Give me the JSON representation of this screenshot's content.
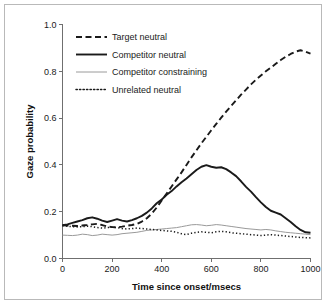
{
  "chart_data": {
    "type": "line",
    "title": "",
    "xlabel": "Time since onset/msecs",
    "ylabel": "Gaze probability",
    "xlim": [
      0,
      1000
    ],
    "ylim": [
      0.0,
      1.0
    ],
    "xticks": [
      0,
      200,
      400,
      600,
      800,
      1000
    ],
    "xtick_labels": [
      "0",
      "200",
      "400",
      "600",
      "800",
      "1000"
    ],
    "yticks": [
      0.0,
      0.2,
      0.4,
      0.6,
      0.8,
      1.0
    ],
    "ytick_labels": [
      "0.0",
      "0.2",
      "0.4",
      "0.6",
      "0.8",
      "1.0"
    ],
    "grid": false,
    "legend_position": "upper left",
    "x": [
      0,
      20,
      40,
      60,
      80,
      100,
      120,
      140,
      160,
      180,
      200,
      220,
      240,
      260,
      280,
      300,
      320,
      340,
      360,
      380,
      400,
      420,
      440,
      460,
      480,
      500,
      520,
      540,
      560,
      580,
      600,
      620,
      640,
      660,
      680,
      700,
      720,
      740,
      760,
      780,
      800,
      820,
      840,
      860,
      880,
      900,
      920,
      940,
      960,
      980,
      1000
    ],
    "series": [
      {
        "name": "Target neutral",
        "style": "dashed",
        "color": "#1a1a1a",
        "width": 1.9,
        "values": [
          0.142,
          0.141,
          0.14,
          0.139,
          0.141,
          0.143,
          0.146,
          0.148,
          0.143,
          0.137,
          0.134,
          0.133,
          0.136,
          0.14,
          0.143,
          0.148,
          0.158,
          0.172,
          0.192,
          0.218,
          0.248,
          0.278,
          0.308,
          0.338,
          0.368,
          0.4,
          0.432,
          0.462,
          0.492,
          0.52,
          0.548,
          0.575,
          0.602,
          0.628,
          0.652,
          0.676,
          0.7,
          0.722,
          0.744,
          0.764,
          0.782,
          0.8,
          0.816,
          0.832,
          0.848,
          0.862,
          0.874,
          0.884,
          0.89,
          0.884,
          0.876
        ]
      },
      {
        "name": "Competitor neutral",
        "style": "solid",
        "color": "#1a1a1a",
        "width": 1.9,
        "values": [
          0.142,
          0.146,
          0.152,
          0.158,
          0.164,
          0.172,
          0.176,
          0.17,
          0.162,
          0.156,
          0.162,
          0.168,
          0.162,
          0.158,
          0.164,
          0.172,
          0.182,
          0.196,
          0.214,
          0.236,
          0.252,
          0.272,
          0.288,
          0.308,
          0.326,
          0.342,
          0.36,
          0.378,
          0.392,
          0.399,
          0.392,
          0.388,
          0.39,
          0.382,
          0.368,
          0.352,
          0.33,
          0.306,
          0.286,
          0.262,
          0.24,
          0.22,
          0.204,
          0.196,
          0.188,
          0.172,
          0.156,
          0.138,
          0.122,
          0.112,
          0.11
        ]
      },
      {
        "name": "Competitor constraining",
        "style": "solid",
        "color": "#9a9a9a",
        "width": 1.0,
        "values": [
          0.1,
          0.099,
          0.098,
          0.1,
          0.104,
          0.102,
          0.098,
          0.1,
          0.104,
          0.102,
          0.1,
          0.102,
          0.106,
          0.108,
          0.11,
          0.112,
          0.116,
          0.12,
          0.122,
          0.124,
          0.126,
          0.128,
          0.13,
          0.132,
          0.136,
          0.14,
          0.144,
          0.145,
          0.143,
          0.14,
          0.142,
          0.145,
          0.143,
          0.14,
          0.137,
          0.134,
          0.131,
          0.128,
          0.126,
          0.124,
          0.122,
          0.124,
          0.122,
          0.118,
          0.115,
          0.112,
          0.11,
          0.108,
          0.106,
          0.104,
          0.102
        ]
      },
      {
        "name": "Unrelated neutral",
        "style": "dotted",
        "color": "#1a1a1a",
        "width": 1.5,
        "values": [
          0.14,
          0.138,
          0.136,
          0.135,
          0.136,
          0.138,
          0.136,
          0.132,
          0.13,
          0.132,
          0.134,
          0.132,
          0.128,
          0.126,
          0.128,
          0.13,
          0.128,
          0.126,
          0.124,
          0.122,
          0.12,
          0.118,
          0.116,
          0.112,
          0.106,
          0.102,
          0.108,
          0.112,
          0.114,
          0.112,
          0.11,
          0.114,
          0.116,
          0.114,
          0.11,
          0.108,
          0.106,
          0.104,
          0.102,
          0.1,
          0.098,
          0.1,
          0.102,
          0.1,
          0.098,
          0.096,
          0.094,
          0.092,
          0.09,
          0.089,
          0.088
        ]
      }
    ]
  },
  "legend": {
    "entries": [
      {
        "label": "Target neutral"
      },
      {
        "label": "Competitor neutral"
      },
      {
        "label": "Competitor constraining"
      },
      {
        "label": "Unrelated neutral"
      }
    ]
  },
  "colors": {
    "primary": "#1a1a1a",
    "secondary": "#9a9a9a",
    "axis": "#6f6f6f",
    "frame": "#b9b9b9",
    "background": "#ffffff"
  }
}
